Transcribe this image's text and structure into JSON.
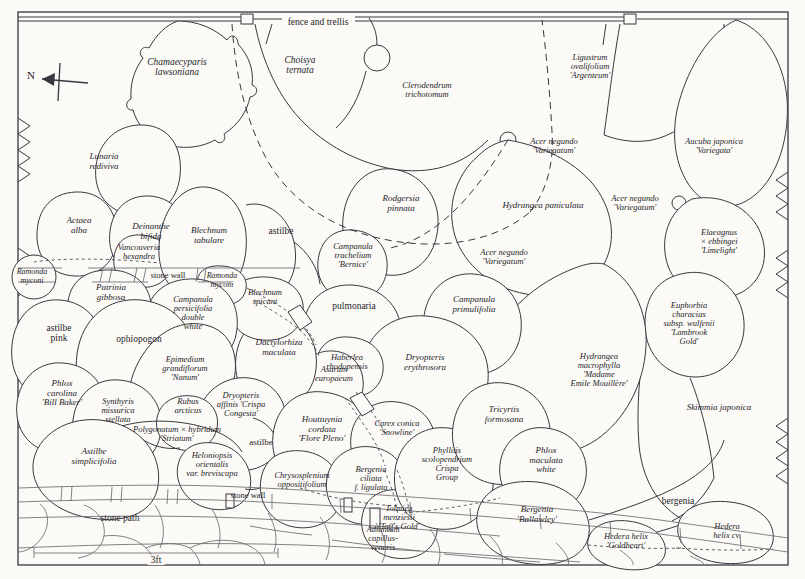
{
  "meta": {
    "orientation_label": "N",
    "scale_label": "3ft",
    "stroke_color": "#3a3740",
    "background_color": "#fbfaf6",
    "text_color": "#26242a"
  },
  "structures": [
    {
      "name": "fence-and-trellis",
      "label": "fence and trellis",
      "x": 318,
      "y": 22,
      "size": 9.5,
      "style": "ro"
    },
    {
      "name": "stone-wall-upper",
      "label": "stone wall",
      "x": 168,
      "y": 276,
      "size": 8.5,
      "style": "ro"
    },
    {
      "name": "stone-wall-lower",
      "label": "stone wall",
      "x": 248,
      "y": 496,
      "size": 8.5,
      "style": "ro"
    },
    {
      "name": "stone-path",
      "label": "stone path",
      "x": 120,
      "y": 518,
      "size": 9.5,
      "style": "ro"
    }
  ],
  "plants": [
    {
      "name": "chamaecyparis-lawsoniana",
      "label": "Chamaecyparis\nlawsoniana",
      "x": 177,
      "y": 67,
      "size": 9.5,
      "style": "it"
    },
    {
      "name": "choisya-ternata",
      "label": "Choisya\nternata",
      "x": 300,
      "y": 65,
      "size": 9.5,
      "style": "it"
    },
    {
      "name": "clerodendrum-trichotomum",
      "label": "Clerodendrum\ntrichotomum",
      "x": 427,
      "y": 90,
      "size": 8.5,
      "style": "it"
    },
    {
      "name": "ligustrum-ovalifolium-argenteum",
      "label": "Ligustrum\novalifolium\n'Argenteum'",
      "x": 590,
      "y": 67,
      "size": 8.5,
      "style": "it"
    },
    {
      "name": "aucuba-japonica-variegata",
      "label": "Aucuba japonica\n'Variegata'",
      "x": 714,
      "y": 146,
      "size": 8.5,
      "style": "it"
    },
    {
      "name": "acer-negundo-variegatum-top",
      "label": "Acer negundo\n'Variegatum'",
      "x": 554,
      "y": 146,
      "size": 8.5,
      "style": "it"
    },
    {
      "name": "acer-negundo-variegatum-right",
      "label": "Acer negundo\n'Variegatum'",
      "x": 635,
      "y": 203,
      "size": 8.5,
      "style": "it"
    },
    {
      "name": "acer-negundo-variegatum-mid",
      "label": "Acer negundo\n'Variegatum'",
      "x": 504,
      "y": 257,
      "size": 8.5,
      "style": "it"
    },
    {
      "name": "lunaria-rediviva",
      "label": "Lunaria\nrediviva",
      "x": 104,
      "y": 162,
      "size": 9,
      "style": "it"
    },
    {
      "name": "actaea-alba",
      "label": "Actaea\nalba",
      "x": 79,
      "y": 226,
      "size": 9,
      "style": "it"
    },
    {
      "name": "deinanthe-bifida",
      "label": "Deinanthe\nbifida",
      "x": 151,
      "y": 232,
      "size": 9,
      "style": "it"
    },
    {
      "name": "vancouveria-hexandra",
      "label": "Vancouveria\nhexandra",
      "x": 139,
      "y": 252,
      "size": 8.5,
      "style": "it"
    },
    {
      "name": "blechnum-tabulare",
      "label": "Blechnum\ntabulare",
      "x": 209,
      "y": 236,
      "size": 9,
      "style": "it"
    },
    {
      "name": "astilbe-upper",
      "label": "astilbe",
      "x": 281,
      "y": 231,
      "size": 9.5,
      "style": "ro"
    },
    {
      "name": "rodgersia-pinnata",
      "label": "Rodgersia\npinnata",
      "x": 401,
      "y": 204,
      "size": 9,
      "style": "it"
    },
    {
      "name": "hydrangea-paniculata",
      "label": "Hydrangea paniculata",
      "x": 543,
      "y": 206,
      "size": 9,
      "style": "it"
    },
    {
      "name": "campanula-trachelium-bernice",
      "label": "Campanula\ntrachelium\n'Bernice'",
      "x": 353,
      "y": 256,
      "size": 8.5,
      "style": "it"
    },
    {
      "name": "elaeagnus-ebbingei-limelight",
      "label": "Elaeagnus\n× ebbingei\n'Limelight'",
      "x": 719,
      "y": 242,
      "size": 8.5,
      "style": "it"
    },
    {
      "name": "euphorbia-characias-wulfenii-lambrook-gold",
      "label": "Euphorbia\ncharacias\nsubsp. wulfenii\n'Lambrook\nGold'",
      "x": 689,
      "y": 324,
      "size": 8.5,
      "style": "it"
    },
    {
      "name": "ramonda-myconi-left",
      "label": "Ramonda\nmyconi",
      "x": 32,
      "y": 277,
      "size": 8,
      "style": "it"
    },
    {
      "name": "ramonda-myconi-mid",
      "label": "Ramonda\nmyconi",
      "x": 222,
      "y": 281,
      "size": 8,
      "style": "it"
    },
    {
      "name": "blechnum-spicant",
      "label": "Blechnum\nspicant",
      "x": 265,
      "y": 297,
      "size": 8.5,
      "style": "it"
    },
    {
      "name": "patrinia-gibbosa",
      "label": "Patrinia\ngibbosa",
      "x": 111,
      "y": 293,
      "size": 9,
      "style": "it"
    },
    {
      "name": "campanula-persicifolia-double-white",
      "label": "Campanula\npersicifolia\ndouble\nwhite",
      "x": 193,
      "y": 313,
      "size": 8.5,
      "style": "it"
    },
    {
      "name": "pulmonaria",
      "label": "pulmonaria",
      "x": 354,
      "y": 306,
      "size": 9.5,
      "style": "ro"
    },
    {
      "name": "campanula-primulifolia",
      "label": "Campanula\nprimulifolia",
      "x": 474,
      "y": 305,
      "size": 9,
      "style": "it"
    },
    {
      "name": "astilbe-pink",
      "label": "astilbe\npink",
      "x": 59,
      "y": 333,
      "size": 9.5,
      "style": "ro"
    },
    {
      "name": "ophiopogon",
      "label": "ophiopogon",
      "x": 139,
      "y": 339,
      "size": 9.5,
      "style": "ro"
    },
    {
      "name": "dactylorhiza-maculata",
      "label": "Dactylorhiza\nmaculata",
      "x": 279,
      "y": 348,
      "size": 9,
      "style": "it"
    },
    {
      "name": "epimedium-grandiflorum-nanum",
      "label": "Epimedium\ngrandiflorum\n'Nanum'",
      "x": 185,
      "y": 369,
      "size": 8.5,
      "style": "it"
    },
    {
      "name": "asarum-europaeum",
      "label": "Asarum\neuropaeum",
      "x": 334,
      "y": 374,
      "size": 8.5,
      "style": "it"
    },
    {
      "name": "haberlea-rhodopensis",
      "label": "Haberlea\nrhodopensis",
      "x": 347,
      "y": 362,
      "size": 8.5,
      "style": "it"
    },
    {
      "name": "dryopteris-erythrosora",
      "label": "Dryopteris\nerythrosora",
      "x": 425,
      "y": 363,
      "size": 9,
      "style": "it"
    },
    {
      "name": "hydrangea-macrophylla-madame-emile-mouillere",
      "label": "Hydrangea\nmacrophylla\n'Madame\nEmile Mouillère'",
      "x": 599,
      "y": 370,
      "size": 8.5,
      "style": "it"
    },
    {
      "name": "skimmia-japonica",
      "label": "Skimmia japonica",
      "x": 719,
      "y": 408,
      "size": 9,
      "style": "it"
    },
    {
      "name": "phlox-carolina-bill-baker",
      "label": "Phlox\ncarolina\n'Bill Baker'",
      "x": 62,
      "y": 393,
      "size": 9,
      "style": "it"
    },
    {
      "name": "synthyris-missurica-stellata",
      "label": "Synthyris\nmissurica\nstellata",
      "x": 118,
      "y": 411,
      "size": 8.5,
      "style": "it"
    },
    {
      "name": "dryopteris-affinis-crispa-congesta",
      "label": "Dryopteris\naffinis 'Crispa\nCongesta'",
      "x": 241,
      "y": 405,
      "size": 8.5,
      "style": "it"
    },
    {
      "name": "rubus-arcticus",
      "label": "Rubus\narcticus",
      "x": 188,
      "y": 406,
      "size": 8.5,
      "style": "it"
    },
    {
      "name": "polygonatum-hybridum-striatum",
      "label": "Polygonatum × hybridum\n'Striatum'",
      "x": 177,
      "y": 434,
      "size": 8.5,
      "style": "it"
    },
    {
      "name": "heloniopsis-orientalis-breviscapa",
      "label": "Heloniopsis\norientalis\nvar. breviscapa",
      "x": 212,
      "y": 465,
      "size": 8.5,
      "style": "it"
    },
    {
      "name": "astilbe-lower",
      "label": "astilbe",
      "x": 261,
      "y": 443,
      "size": 9,
      "style": "ro"
    },
    {
      "name": "astilbe-simplicifolia",
      "label": "Astilbe\nsimplicifolia",
      "x": 94,
      "y": 457,
      "size": 9,
      "style": "it"
    },
    {
      "name": "houttuynia-cordata-flore-pleno",
      "label": "Houttuynia\ncordata\n'Flore Pleno'",
      "x": 322,
      "y": 429,
      "size": 9,
      "style": "it"
    },
    {
      "name": "carex-conica-snowline",
      "label": "Carex conica\n'Snowline'",
      "x": 397,
      "y": 428,
      "size": 8.5,
      "style": "it"
    },
    {
      "name": "tricyrtis-formosana",
      "label": "Tricyrtis\nformosana",
      "x": 504,
      "y": 415,
      "size": 9,
      "style": "it"
    },
    {
      "name": "phlox-maculata-white",
      "label": "Phlox\nmaculata\nwhite",
      "x": 546,
      "y": 460,
      "size": 9,
      "style": "it"
    },
    {
      "name": "phyllitis-scolopendrium-crispa-group",
      "label": "Phyllitis\nscolopendrium\nCrispa\nGroup",
      "x": 447,
      "y": 464,
      "size": 8.5,
      "style": "it"
    },
    {
      "name": "chrysosplenium-oppositifolium",
      "label": "Chrysosplenium\noppositifolium",
      "x": 302,
      "y": 480,
      "size": 8.5,
      "style": "it"
    },
    {
      "name": "bergenia-ciliata-ligulata",
      "label": "Bergenia\nciliata\nf. ligulata",
      "x": 371,
      "y": 479,
      "size": 8.5,
      "style": "it"
    },
    {
      "name": "tolmiea-menziesii-taffs-gold",
      "label": "Tolmiea\nmenziesii\n'Taff's Gold'",
      "x": 399,
      "y": 518,
      "size": 8.5,
      "style": "it"
    },
    {
      "name": "adiantum-capillus-veneris",
      "label": "Adiantum\ncapillus-\nveneris",
      "x": 383,
      "y": 539,
      "size": 8.5,
      "style": "it"
    },
    {
      "name": "bergenia-ballawley",
      "label": "Bergenia\n'Ballawley'",
      "x": 537,
      "y": 515,
      "size": 9,
      "style": "it"
    },
    {
      "name": "bergenia-plain",
      "label": "bergenia",
      "x": 678,
      "y": 501,
      "size": 9.5,
      "style": "ro"
    },
    {
      "name": "hedera-helix-goldheart",
      "label": "Hedera helix\n'Goldheart'",
      "x": 626,
      "y": 541,
      "size": 8.5,
      "style": "it"
    },
    {
      "name": "hedera-helix-cv",
      "label": "Hedera\nhelix cv.",
      "x": 727,
      "y": 531,
      "size": 8.5,
      "style": "it"
    }
  ]
}
